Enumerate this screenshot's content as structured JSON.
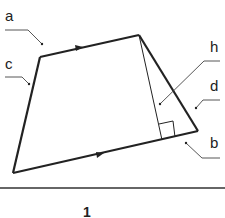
{
  "diagram": {
    "type": "trapezoid",
    "caption": "1",
    "labels": {
      "a": "a",
      "b": "b",
      "c": "c",
      "d": "d",
      "h": "h"
    },
    "vertices": {
      "top_left": [
        40,
        57
      ],
      "top_right": [
        139,
        35
      ],
      "bottom_right": [
        198,
        131
      ],
      "bottom_left": [
        13,
        173
      ]
    },
    "height_foot": [
      162,
      140
    ],
    "colors": {
      "stroke": "#222222",
      "background": "#ffffff"
    }
  }
}
